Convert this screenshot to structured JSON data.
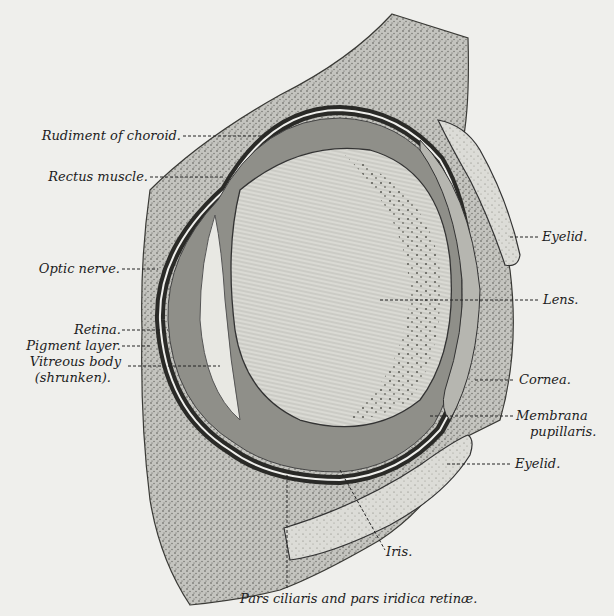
{
  "figure": {
    "colors": {
      "background": "#efefec",
      "ink": "#1c1c1c",
      "tissue_light": "#cfcfca",
      "tissue_mid": "#a9a9a3",
      "tissue_dark": "#3c3c38",
      "lens": "#d9d9d3"
    }
  },
  "labels": {
    "rudiment_of_choroid": "Rudiment of choroid.",
    "rectus_muscle": "Rectus muscle.",
    "optic_nerve": "Optic nerve.",
    "retina": "Retina.",
    "pigment_layer": "Pigment layer.",
    "vitreous_body_1": "Vitreous body",
    "vitreous_body_2": "(shrunken).",
    "eyelid_upper": "Eyelid.",
    "lens": "Lens.",
    "cornea": "Cornea.",
    "membrana_1": "Membrana",
    "membrana_2": "pupillaris.",
    "eyelid_lower": "Eyelid.",
    "iris": "Iris.",
    "pars_ciliaris": "Pars ciliaris and pars iridica retinæ."
  }
}
